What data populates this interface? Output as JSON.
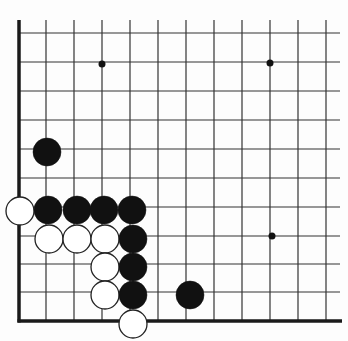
{
  "diagram": {
    "type": "go-board-corner",
    "corner": "bottom-left",
    "colors": {
      "background": "#fdfdfd",
      "line": "#333333",
      "edge": "#1a1a1a",
      "black": "#111111",
      "white": "#ffffff"
    },
    "grid": {
      "x_lines": [
        19,
        46,
        74,
        102,
        130,
        158,
        186,
        214,
        242,
        270,
        298,
        326
      ],
      "y_lines": [
        33,
        62,
        91,
        120,
        149,
        178,
        207,
        236,
        264,
        292,
        321
      ],
      "x_extent": [
        19,
        340
      ],
      "y_extent": [
        20,
        321
      ]
    },
    "star_points": [
      {
        "x": 102,
        "y": 64
      },
      {
        "x": 270,
        "y": 63
      },
      {
        "x": 272,
        "y": 236
      }
    ],
    "stones": [
      {
        "color": "black",
        "x": 47,
        "y": 152
      },
      {
        "color": "white",
        "x": 20,
        "y": 211
      },
      {
        "color": "black",
        "x": 48,
        "y": 210
      },
      {
        "color": "black",
        "x": 77,
        "y": 210
      },
      {
        "color": "black",
        "x": 104,
        "y": 210
      },
      {
        "color": "black",
        "x": 132,
        "y": 210
      },
      {
        "color": "white",
        "x": 49,
        "y": 239
      },
      {
        "color": "white",
        "x": 77,
        "y": 239
      },
      {
        "color": "white",
        "x": 105,
        "y": 239
      },
      {
        "color": "black",
        "x": 133,
        "y": 239
      },
      {
        "color": "white",
        "x": 105,
        "y": 267
      },
      {
        "color": "black",
        "x": 133,
        "y": 267
      },
      {
        "color": "white",
        "x": 105,
        "y": 295
      },
      {
        "color": "black",
        "x": 133,
        "y": 295
      },
      {
        "color": "black",
        "x": 190,
        "y": 295
      },
      {
        "color": "white",
        "x": 133,
        "y": 324
      }
    ],
    "stone_radius": 14
  }
}
